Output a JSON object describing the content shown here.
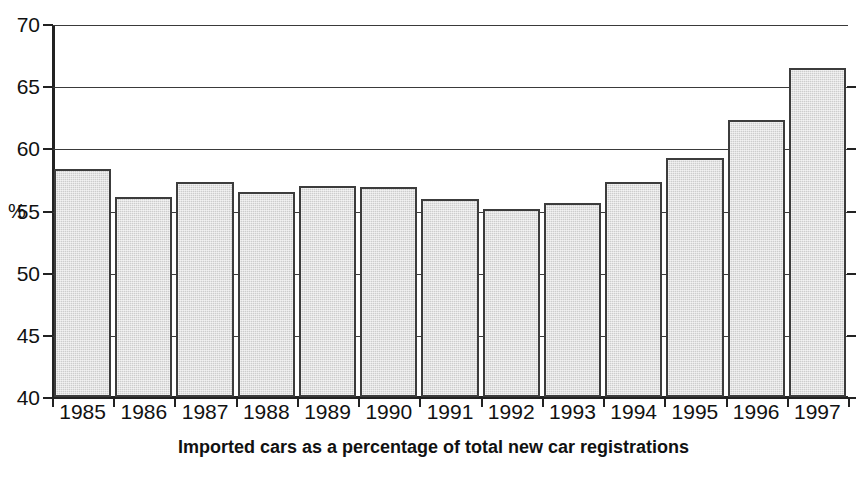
{
  "chart_data": {
    "type": "bar",
    "title": "Imported cars as a percentage of total new car registrations",
    "xlabel": "",
    "ylabel": "%",
    "ylim": [
      40,
      70
    ],
    "yticks": [
      40,
      45,
      50,
      55,
      60,
      65,
      70
    ],
    "grid": true,
    "legend": false,
    "categories": [
      "1985",
      "1986",
      "1987",
      "1988",
      "1989",
      "1990",
      "1991",
      "1992",
      "1993",
      "1994",
      "1995",
      "1996",
      "1997"
    ],
    "values": [
      58.3,
      56.1,
      57.3,
      56.5,
      57.0,
      56.9,
      55.9,
      55.1,
      55.6,
      57.3,
      59.2,
      62.3,
      66.5
    ],
    "series": [
      {
        "name": "Imported cars share of new car registrations",
        "values": [
          58.3,
          56.1,
          57.3,
          56.5,
          57.0,
          56.9,
          55.9,
          55.1,
          55.6,
          57.3,
          59.2,
          62.3,
          66.5
        ]
      }
    ],
    "bar_fill_color": "#cdcdcd",
    "bar_edge_color": "#3c3c3c",
    "axis_color": "#222222",
    "gridline_color": "#3a3a3a",
    "background_color": "#ffffff"
  },
  "axis": {
    "y_label": "%",
    "y_tick_labels": [
      "70",
      "65",
      "60",
      "55",
      "50",
      "45",
      "40"
    ],
    "x_tick_labels": [
      "1985",
      "1986",
      "1987",
      "1988",
      "1989",
      "1990",
      "1991",
      "1992",
      "1993",
      "1994",
      "1995",
      "1996",
      "1997"
    ]
  },
  "caption": {
    "text": "Imported cars as a percentage of total new car registrations"
  }
}
